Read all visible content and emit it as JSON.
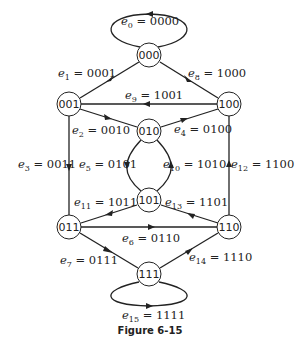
{
  "figure": {
    "caption": "Figure 6-15"
  },
  "nodes": [
    {
      "id": "000",
      "label": "000"
    },
    {
      "id": "001",
      "label": "001"
    },
    {
      "id": "100",
      "label": "100"
    },
    {
      "id": "010",
      "label": "010"
    },
    {
      "id": "101",
      "label": "101"
    },
    {
      "id": "011",
      "label": "011"
    },
    {
      "id": "110",
      "label": "110"
    },
    {
      "id": "111",
      "label": "111"
    }
  ],
  "edges": [
    {
      "name": "e",
      "sub": "0",
      "value": "0000",
      "from": "000",
      "to": "000"
    },
    {
      "name": "e",
      "sub": "1",
      "value": "0001",
      "from": "000",
      "to": "001"
    },
    {
      "name": "e",
      "sub": "2",
      "value": "0010",
      "from": "001",
      "to": "010"
    },
    {
      "name": "e",
      "sub": "3",
      "value": "0011",
      "from": "001",
      "to": "011"
    },
    {
      "name": "e",
      "sub": "4",
      "value": "0100",
      "from": "010",
      "to": "100"
    },
    {
      "name": "e",
      "sub": "5",
      "value": "0101",
      "from": "010",
      "to": "101"
    },
    {
      "name": "e",
      "sub": "6",
      "value": "0110",
      "from": "011",
      "to": "110"
    },
    {
      "name": "e",
      "sub": "7",
      "value": "0111",
      "from": "011",
      "to": "111"
    },
    {
      "name": "e",
      "sub": "8",
      "value": "1000",
      "from": "100",
      "to": "000"
    },
    {
      "name": "e",
      "sub": "9",
      "value": "1001",
      "from": "100",
      "to": "001"
    },
    {
      "name": "e",
      "sub": "10",
      "value": "1010",
      "from": "101",
      "to": "010"
    },
    {
      "name": "e",
      "sub": "11",
      "value": "1011",
      "from": "101",
      "to": "011"
    },
    {
      "name": "e",
      "sub": "12",
      "value": "1100",
      "from": "110",
      "to": "100"
    },
    {
      "name": "e",
      "sub": "13",
      "value": "1101",
      "from": "110",
      "to": "101"
    },
    {
      "name": "e",
      "sub": "14",
      "value": "1110",
      "from": "111",
      "to": "110"
    },
    {
      "name": "e",
      "sub": "15",
      "value": "1111",
      "from": "111",
      "to": "111"
    }
  ],
  "eq": " = "
}
